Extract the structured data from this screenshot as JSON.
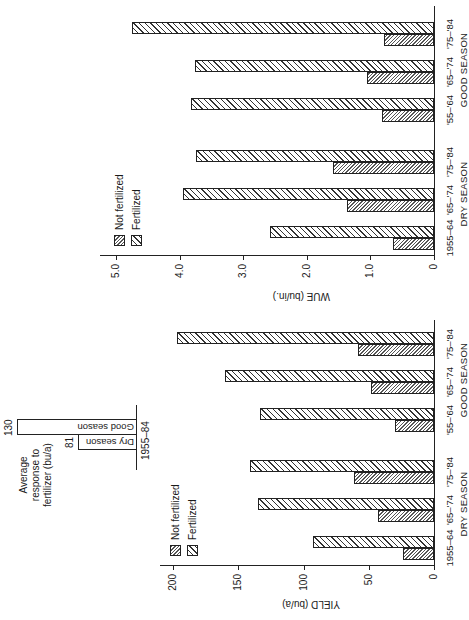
{
  "figure": {
    "caption_fragment": "FIGURE 10-1"
  },
  "yield_chart": {
    "ylabel": "YIELD (bu/a)",
    "ticks": [
      "0",
      "50",
      "100",
      "150",
      "200"
    ],
    "legend": {
      "not_fertilized": "Not fertilized",
      "fertilized": "Fertilized"
    },
    "categories": [
      "1955–64",
      "'65–'74",
      "'75–'84",
      "'55–'64",
      "'65–'74",
      "'75–'84"
    ],
    "groups": [
      "DRY SEASON",
      "GOOD SEASON"
    ],
    "inset": {
      "title_line1": "Average",
      "title_line2": "response to",
      "title_line3": "fertilizer (bu/a)",
      "dry_label": "Dry season",
      "good_label": "Good season",
      "dry_value": "81",
      "good_value": "130",
      "period": "1955–84"
    }
  },
  "wue_chart": {
    "ylabel": "WUE (bu/in.)",
    "ticks": [
      "0",
      "1.0",
      "2.0",
      "3.0",
      "4.0",
      "5.0"
    ],
    "legend": {
      "not_fertilized": "Not fertilized",
      "fertilized": "Fertilized"
    },
    "categories": [
      "1955–64",
      "'65–'74",
      "'75–'84",
      "'55–'64",
      "'65–'74",
      "'75–'84"
    ],
    "groups": [
      "DRY SEASON",
      "GOOD SEASON"
    ]
  },
  "chart_data": [
    {
      "type": "bar",
      "title": "",
      "xlabel": "",
      "ylabel": "YIELD (bu/a)",
      "ylim": [
        0,
        210
      ],
      "categories": [
        "Dry 1955–64",
        "Dry '65–'74",
        "Dry '75–'84",
        "Good '55–'64",
        "Good '65–'74",
        "Good '75–'84"
      ],
      "series": [
        {
          "name": "Not fertilized",
          "values": [
            24,
            43,
            61,
            30,
            48,
            58
          ]
        },
        {
          "name": "Fertilized",
          "values": [
            93,
            135,
            141,
            133,
            160,
            197
          ]
        }
      ],
      "legend_position": "upper left",
      "grid": false,
      "inset": {
        "type": "bar",
        "title": "Average response to fertilizer (bu/a)",
        "categories": [
          "Dry season",
          "Good season"
        ],
        "values": [
          81,
          130
        ],
        "xlabel": "1955–84"
      }
    },
    {
      "type": "bar",
      "title": "",
      "xlabel": "",
      "ylabel": "WUE (bu/in.)",
      "ylim": [
        0,
        5.0
      ],
      "categories": [
        "Dry 1955–64",
        "Dry '65–'74",
        "Dry '75–'84",
        "Good '55–'64",
        "Good '65–'74",
        "Good '75–'84"
      ],
      "series": [
        {
          "name": "Not fertilized",
          "values": [
            0.64,
            1.37,
            1.59,
            0.82,
            1.05,
            0.79
          ]
        },
        {
          "name": "Fertilized",
          "values": [
            2.58,
            3.95,
            3.74,
            3.82,
            3.76,
            4.75
          ]
        }
      ],
      "legend_position": "upper left",
      "grid": false
    }
  ]
}
